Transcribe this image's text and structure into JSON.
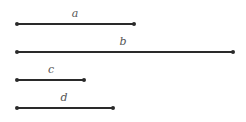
{
  "diagram": {
    "segments": [
      {
        "label": "a",
        "x1": 17,
        "x2": 134,
        "y": 24
      },
      {
        "label": "b",
        "x1": 17,
        "x2": 233,
        "y": 52
      },
      {
        "label": "c",
        "x1": 17,
        "x2": 84,
        "y": 80
      },
      {
        "label": "d",
        "x1": 17,
        "x2": 113,
        "y": 108
      }
    ]
  }
}
